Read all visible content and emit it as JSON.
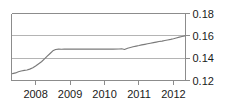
{
  "chart_data": {
    "type": "line",
    "title": "",
    "xlabel": "",
    "ylabel": "",
    "xlim": [
      2007.3,
      2012.35
    ],
    "ylim": [
      0.12,
      0.18
    ],
    "grid": true,
    "legend": null,
    "y_ticks": [
      "0.18",
      "0.16",
      "0.14",
      "0.12"
    ],
    "y_tick_values": [
      0.18,
      0.16,
      0.14,
      0.12
    ],
    "x_ticks": [
      "2008",
      "2009",
      "2010",
      "2011",
      "2012"
    ],
    "x_tick_values": [
      2008,
      2009,
      2010,
      2011,
      2012
    ],
    "y_axis_position": "right",
    "series": [
      {
        "name": "series-1",
        "color": "#7a7a7a",
        "x": [
          2007.33,
          2007.42,
          2007.5,
          2007.58,
          2007.67,
          2007.75,
          2007.83,
          2007.92,
          2008.0,
          2008.08,
          2008.17,
          2008.25,
          2008.33,
          2008.42,
          2008.5,
          2008.58,
          2008.67,
          2008.75,
          2008.83,
          2008.92,
          2009.0,
          2009.25,
          2009.5,
          2009.75,
          2010.0,
          2010.25,
          2010.42,
          2010.5,
          2010.58,
          2010.67,
          2010.75,
          2010.83,
          2010.92,
          2011.0,
          2011.08,
          2011.17,
          2011.25,
          2011.33,
          2011.42,
          2011.5,
          2011.58,
          2011.67,
          2011.75,
          2011.83,
          2011.92,
          2012.0,
          2012.08,
          2012.17,
          2012.25,
          2012.33
        ],
        "y": [
          0.1262,
          0.1268,
          0.1278,
          0.1285,
          0.1291,
          0.1294,
          0.1302,
          0.1314,
          0.133,
          0.1348,
          0.1368,
          0.1392,
          0.1416,
          0.1442,
          0.1466,
          0.1478,
          0.1481,
          0.148,
          0.1482,
          0.1481,
          0.1482,
          0.1481,
          0.1482,
          0.1481,
          0.1482,
          0.1481,
          0.1482,
          0.1484,
          0.1478,
          0.1489,
          0.1496,
          0.1502,
          0.1508,
          0.1513,
          0.1519,
          0.1524,
          0.1529,
          0.1534,
          0.1539,
          0.1544,
          0.1549,
          0.1553,
          0.1558,
          0.1563,
          0.1568,
          0.1574,
          0.1581,
          0.1588,
          0.1594,
          0.16
        ]
      }
    ]
  }
}
